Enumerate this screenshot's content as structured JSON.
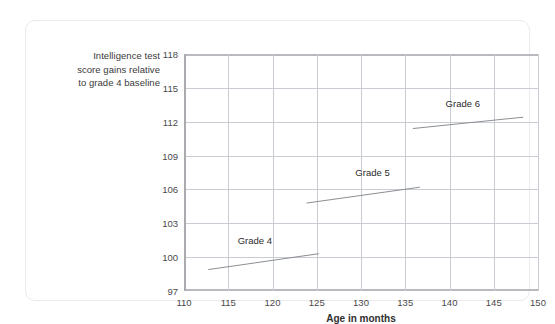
{
  "chart_data": {
    "type": "line",
    "title": "",
    "xlabel": "Age in months",
    "ylabel": "Intelligence test score gains relative to grade 4 baseline",
    "xlim": [
      110,
      150
    ],
    "ylim": [
      97,
      118
    ],
    "xticks": [
      110,
      115,
      120,
      125,
      130,
      135,
      140,
      145,
      150
    ],
    "yticks": [
      97,
      100,
      103,
      106,
      109,
      112,
      115,
      118
    ],
    "grid": true,
    "legend_position": "inline-annotations",
    "line_color": "#8c8f94",
    "grid_color": "#c9cdd3",
    "series": [
      {
        "name": "Grade 4",
        "label": "Grade 4",
        "label_x": 118.0,
        "label_y": 101.0,
        "x": [
          112.8,
          125.2
        ],
        "y": [
          98.9,
          100.3
        ]
      },
      {
        "name": "Grade 5",
        "label": "Grade 5",
        "label_x": 131.3,
        "label_y": 107.0,
        "x": [
          123.9,
          136.6
        ],
        "y": [
          104.8,
          106.2
        ]
      },
      {
        "name": "Grade 6",
        "label": "Grade 6",
        "label_x": 141.5,
        "label_y": 113.1,
        "x": [
          135.9,
          148.3
        ],
        "y": [
          111.4,
          112.4
        ]
      }
    ]
  },
  "axis_title_lines": [
    "Intelligence test",
    "score gains relative",
    "to grade 4 baseline"
  ]
}
